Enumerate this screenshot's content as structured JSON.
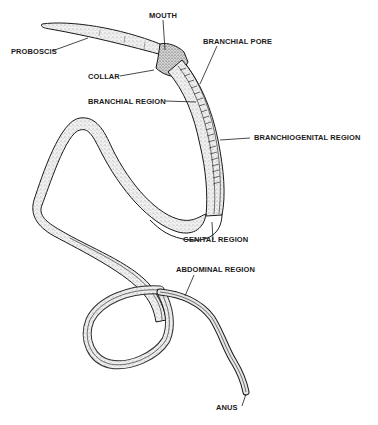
{
  "diagram": {
    "colors": {
      "ink": "#1a1a1a",
      "body_fill": "#d9d9d9",
      "background": "#ffffff"
    },
    "labels": {
      "mouth": "MOUTH",
      "proboscis": "PROBOSCIS",
      "branchial_pore": "BRANCHIAL PORE",
      "collar": "COLLAR",
      "branchial_region": "BRANCHIAL REGION",
      "branchiogenital_region": "BRANCHIOGENITAL REGION",
      "genital_region": "GENITAL REGION",
      "abdominal_region": "ABDOMINAL REGION",
      "anus": "ANUS"
    }
  }
}
